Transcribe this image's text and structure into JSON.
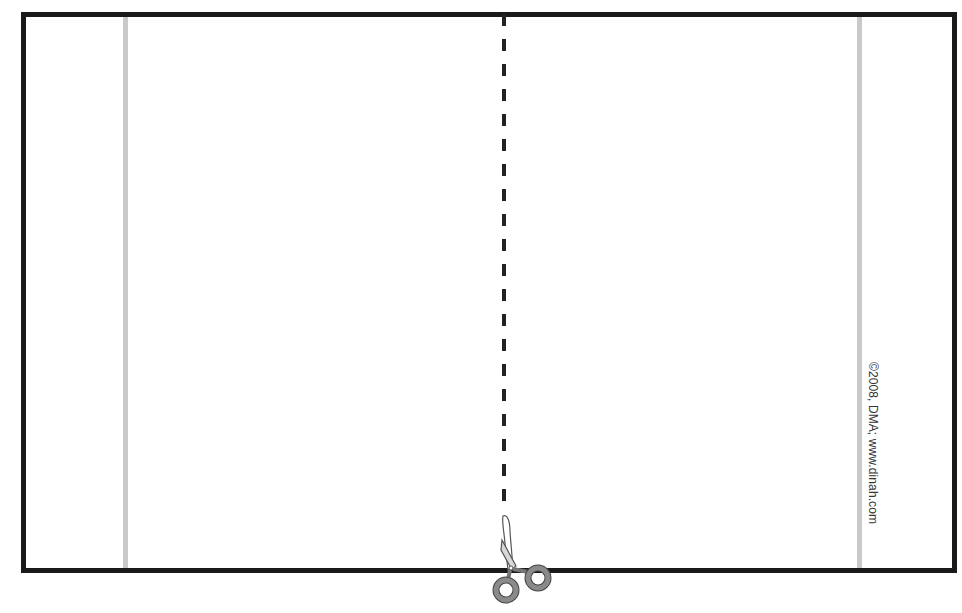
{
  "page": {
    "title_cutoff": "",
    "copyright": "©2008, DMA; www.dinah.com"
  },
  "icons": {
    "scissors": "scissors-icon"
  },
  "colors": {
    "frame": "#1a1a1a",
    "fold_line": "#c9c9c9",
    "cut_line": "#222222",
    "scissors_handle": "#8a8a8a"
  }
}
